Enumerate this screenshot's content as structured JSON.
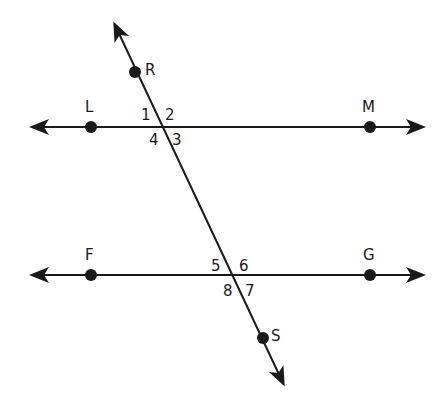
{
  "diagram": {
    "type": "parallel-lines-transversal",
    "colors": {
      "line": "#1a1a1a",
      "background": "#ffffff"
    },
    "lines": [
      {
        "name": "LM",
        "x1": 33,
        "y1": 127,
        "x2": 422,
        "y2": 127,
        "arrows": "both"
      },
      {
        "name": "FG",
        "x1": 33,
        "y1": 275,
        "x2": 422,
        "y2": 275,
        "arrows": "both"
      },
      {
        "name": "RS",
        "x1": 115,
        "y1": 25,
        "x2": 283,
        "y2": 383,
        "arrows": "both"
      }
    ],
    "points": [
      {
        "label": "R",
        "x": 135,
        "y": 72,
        "lx": 145,
        "ly": 75
      },
      {
        "label": "L",
        "x": 91,
        "y": 127,
        "lx": 85,
        "ly": 112
      },
      {
        "label": "M",
        "x": 370,
        "y": 127,
        "lx": 362,
        "ly": 112
      },
      {
        "label": "F",
        "x": 91,
        "y": 275,
        "lx": 85,
        "ly": 260
      },
      {
        "label": "G",
        "x": 370,
        "y": 275,
        "lx": 363,
        "ly": 260
      },
      {
        "label": "S",
        "x": 263,
        "y": 338,
        "lx": 271,
        "ly": 341
      }
    ],
    "angles": [
      {
        "label": "1",
        "x": 141,
        "y": 120
      },
      {
        "label": "2",
        "x": 165,
        "y": 120
      },
      {
        "label": "4",
        "x": 149,
        "y": 145
      },
      {
        "label": "3",
        "x": 172,
        "y": 145
      },
      {
        "label": "5",
        "x": 211,
        "y": 271
      },
      {
        "label": "6",
        "x": 239,
        "y": 271
      },
      {
        "label": "8",
        "x": 223,
        "y": 296
      },
      {
        "label": "7",
        "x": 245,
        "y": 296
      }
    ]
  }
}
